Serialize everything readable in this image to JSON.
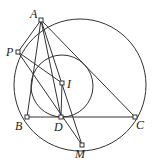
{
  "diagram": {
    "type": "geometry",
    "stroke_color": "#333333",
    "circumcircle": {
      "cx": 80,
      "cy": 85,
      "r": 66
    },
    "incircle": {
      "cx": 62,
      "cy": 86,
      "r": 31
    },
    "points": {
      "A": {
        "label": "A",
        "x": 41,
        "y": 20
      },
      "P": {
        "label": "P",
        "x": 18,
        "y": 52
      },
      "I": {
        "label": "I",
        "x": 62,
        "y": 83
      },
      "B": {
        "label": "B",
        "x": 27,
        "y": 117
      },
      "D": {
        "label": "D",
        "x": 61,
        "y": 117
      },
      "C": {
        "label": "C",
        "x": 135,
        "y": 117
      },
      "M": {
        "label": "M",
        "x": 82,
        "y": 145
      }
    },
    "segments": [
      [
        "A",
        "P"
      ],
      [
        "A",
        "B"
      ],
      [
        "A",
        "C"
      ],
      [
        "A",
        "D"
      ],
      [
        "A",
        "M"
      ],
      [
        "B",
        "C"
      ],
      [
        "P",
        "I"
      ],
      [
        "P",
        "M"
      ],
      [
        "I",
        "D"
      ]
    ]
  }
}
